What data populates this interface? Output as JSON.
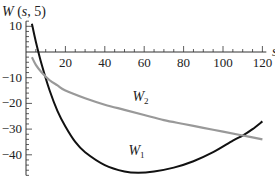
{
  "chart_data": {
    "type": "line",
    "title": "W (s, 5)",
    "xlabel": "s",
    "ylabel": "W (s, 5)",
    "xlim": [
      0,
      122
    ],
    "ylim": [
      -48,
      12
    ],
    "grid": false,
    "x_ticks": [
      20,
      40,
      60,
      80,
      100,
      120
    ],
    "y_ticks": [
      10,
      -10,
      -20,
      -30,
      -40
    ],
    "series": [
      {
        "name": "W1",
        "color": "#111111",
        "x": [
          3,
          5,
          8,
          12,
          16,
          20,
          25,
          30,
          40,
          50,
          57,
          65,
          75,
          85,
          95,
          105,
          110,
          115,
          120
        ],
        "y": [
          11,
          4,
          -5,
          -15,
          -23,
          -29,
          -35,
          -39,
          -44,
          -46.5,
          -47,
          -46.5,
          -45,
          -42.5,
          -39,
          -34.5,
          -32.5,
          -30,
          -27
        ]
      },
      {
        "name": "W2",
        "color": "#999999",
        "x": [
          3,
          5,
          8,
          12,
          16,
          20,
          30,
          40,
          50,
          60,
          70,
          80,
          90,
          100,
          110,
          120
        ],
        "y": [
          -2,
          -5,
          -8,
          -11,
          -13,
          -15,
          -18,
          -20.5,
          -22.5,
          -24.5,
          -26.5,
          -28,
          -29.5,
          -31,
          -32.5,
          -34
        ]
      }
    ],
    "annotations": [
      {
        "text": "W",
        "sub": "2",
        "x": 54,
        "y": -19
      },
      {
        "text": "W",
        "sub": "1",
        "x": 52,
        "y": -40
      }
    ]
  }
}
